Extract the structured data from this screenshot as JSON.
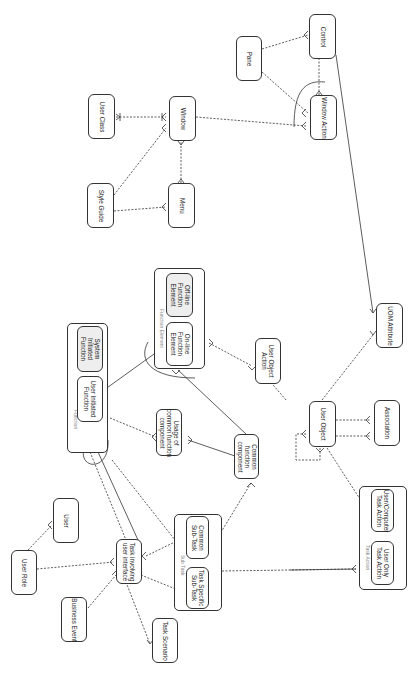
{
  "diagram": {
    "type": "entity-relationship",
    "orientation": "rotated-90",
    "colors": {
      "stroke": "#333333",
      "shaded_fill": "#eeeeee",
      "group_label": "#888888"
    },
    "groups": [
      {
        "id": "function",
        "label": "Function"
      },
      {
        "id": "function_element",
        "label": "Function Element"
      },
      {
        "id": "sub_task",
        "label": "Sub Task"
      },
      {
        "id": "task_action",
        "label": "Task Action"
      }
    ],
    "entities": [
      {
        "id": "user_class",
        "label": "User Class"
      },
      {
        "id": "window",
        "label": "Window"
      },
      {
        "id": "style_guide",
        "label": "Style Guide"
      },
      {
        "id": "menu",
        "label": "Menu"
      },
      {
        "id": "pane",
        "label": "Pane"
      },
      {
        "id": "control",
        "label": "Control"
      },
      {
        "id": "window_action",
        "label": "Window Action"
      },
      {
        "id": "system_initiated_function",
        "label": "System\nInitiated\nFunction"
      },
      {
        "id": "user_initiated_function",
        "label": "User Initiated\nFunction"
      },
      {
        "id": "off_line_function_element",
        "label": "Off-line\nFunction\nElement"
      },
      {
        "id": "on_line_function_element",
        "label": "On-line\nFunction\nElement"
      },
      {
        "id": "usage_of_common_function_component",
        "label": "Usage of\ncommon function\ncomponent"
      },
      {
        "id": "common_function_component",
        "label": "Common\nfunction\ncomponent"
      },
      {
        "id": "user_object_action",
        "label": "User Object\nAction"
      },
      {
        "id": "uom_attribute",
        "label": "UOM Attribute"
      },
      {
        "id": "user_object",
        "label": "User Object"
      },
      {
        "id": "association",
        "label": "Association"
      },
      {
        "id": "user",
        "label": "User"
      },
      {
        "id": "user_role",
        "label": "User Role"
      },
      {
        "id": "task_involving_user_interface",
        "label": "Task involving\nuser interface"
      },
      {
        "id": "business_event",
        "label": "Business Event"
      },
      {
        "id": "task_scenario",
        "label": "Task Scenario"
      },
      {
        "id": "common_sub_task",
        "label": "Common\nSub-Task"
      },
      {
        "id": "task_specific_sub_task",
        "label": "Task Specific\nSub-Task"
      },
      {
        "id": "user_computer_task_action",
        "label": "User/Computer\nTask Action"
      },
      {
        "id": "user_only_task_action",
        "label": "User Only\nTask Action"
      }
    ],
    "relationships": [
      [
        "user_class",
        "window"
      ],
      [
        "style_guide",
        "window"
      ],
      [
        "style_guide",
        "menu"
      ],
      [
        "menu",
        "window"
      ],
      [
        "window",
        "window_action"
      ],
      [
        "pane",
        "control"
      ],
      [
        "pane",
        "window_action"
      ],
      [
        "control",
        "window_action"
      ],
      [
        "control",
        "uom_attribute"
      ],
      [
        "user_initiated_function",
        "on_line_function_element"
      ],
      [
        "user_initiated_function",
        "usage_of_common_function_component"
      ],
      [
        "common_function_component",
        "usage_of_common_function_component"
      ],
      [
        "common_function_component",
        "on_line_function_element"
      ],
      [
        "on_line_function_element",
        "user_object_action"
      ],
      [
        "user_object",
        "user_object_action"
      ],
      [
        "user_object",
        "uom_attribute"
      ],
      [
        "user_object",
        "association"
      ],
      [
        "user_object",
        "user_object"
      ],
      [
        "user_object",
        "user_computer_task_action"
      ],
      [
        "user_role",
        "user"
      ],
      [
        "user_role",
        "task_involving_user_interface"
      ],
      [
        "business_event",
        "task_involving_user_interface"
      ],
      [
        "task_involving_user_interface",
        "task_scenario"
      ],
      [
        "task_involving_user_interface",
        "common_sub_task"
      ],
      [
        "task_involving_user_interface",
        "task_specific_sub_task"
      ],
      [
        "task_involving_user_interface",
        "user_initiated_function"
      ],
      [
        "common_function_component",
        "common_sub_task"
      ],
      [
        "sub_task",
        "task_action"
      ]
    ]
  }
}
